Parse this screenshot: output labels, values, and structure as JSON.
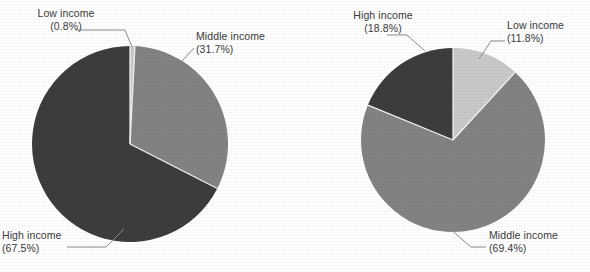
{
  "figure": {
    "background": "#ffffff",
    "text_color": "#3b3b3b"
  },
  "chart_data": [
    {
      "type": "pie",
      "id": "left-pie",
      "title": "",
      "categories": [
        "Low income",
        "Middle income",
        "High income"
      ],
      "values": [
        0.8,
        31.7,
        67.5
      ],
      "labels": [
        "Low income",
        "Middle income",
        "High income"
      ],
      "value_labels": [
        "(0.8%)",
        "(31.7%)",
        "(67.5%)"
      ],
      "colors": [
        "#c9c9c9",
        "#838383",
        "#3d3d3d"
      ],
      "start_angle_deg": 0,
      "direction": "clockwise",
      "legend": "none",
      "center": [
        130,
        144
      ],
      "radius": 98
    },
    {
      "type": "pie",
      "id": "right-pie",
      "title": "",
      "categories": [
        "Low income",
        "Middle income",
        "High income"
      ],
      "values": [
        11.8,
        69.4,
        18.8
      ],
      "labels": [
        "Low income",
        "Middle income",
        "High income"
      ],
      "value_labels": [
        "(11.8%)",
        "(69.4%)",
        "(18.8%)"
      ],
      "colors": [
        "#c9c9c9",
        "#838383",
        "#3d3d3d"
      ],
      "start_angle_deg": 0,
      "direction": "clockwise",
      "legend": "none",
      "center": [
        158,
        140
      ],
      "radius": 92
    }
  ],
  "left_chart": {
    "low": {
      "name": "Low income",
      "pct": "(0.8%)"
    },
    "middle": {
      "name": "Middle income",
      "pct": "(31.7%)"
    },
    "high": {
      "name": "High income",
      "pct": "(67.5%)"
    }
  },
  "right_chart": {
    "low": {
      "name": "Low income",
      "pct": "(11.8%)"
    },
    "middle": {
      "name": "Middle income",
      "pct": "(69.4%)"
    },
    "high": {
      "name": "High income",
      "pct": "(18.8%)"
    }
  }
}
